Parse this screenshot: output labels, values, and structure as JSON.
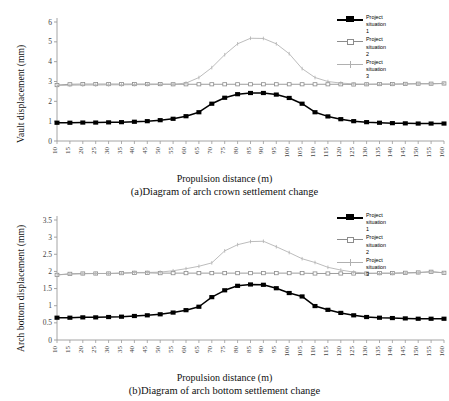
{
  "chart_data": [
    {
      "id": "a",
      "type": "line",
      "title": "(a)Diagram of arch crown settlement change",
      "xlabel": "Propulsion distance (m)",
      "ylabel": "Vault displacement (mm)",
      "xlim": [
        10,
        160
      ],
      "ylim": [
        0,
        6
      ],
      "yticks": [
        "0",
        "1",
        "2",
        "3",
        "4",
        "5",
        "6"
      ],
      "grid": false,
      "legend_position": "top-right",
      "x": [
        10,
        15,
        20,
        25,
        30,
        35,
        40,
        45,
        50,
        55,
        60,
        65,
        70,
        75,
        80,
        85,
        90,
        95,
        100,
        105,
        110,
        115,
        120,
        125,
        130,
        135,
        140,
        145,
        150,
        155,
        160
      ],
      "series": [
        {
          "name": "Project\nsituation\n1",
          "color": "#000000",
          "marker": "square",
          "values": [
            0.92,
            0.92,
            0.93,
            0.93,
            0.94,
            0.95,
            0.97,
            1.0,
            1.05,
            1.12,
            1.25,
            1.45,
            1.88,
            2.18,
            2.36,
            2.42,
            2.42,
            2.34,
            2.17,
            1.88,
            1.45,
            1.24,
            1.1,
            1.0,
            0.95,
            0.92,
            0.9,
            0.89,
            0.88,
            0.88,
            0.88
          ]
        },
        {
          "name": "Project\nsituation\n2",
          "color": "#8c8c8c",
          "marker": "square-open",
          "values": [
            2.82,
            2.86,
            2.87,
            2.87,
            2.87,
            2.87,
            2.87,
            2.87,
            2.87,
            2.86,
            2.86,
            2.86,
            2.86,
            2.86,
            2.86,
            2.86,
            2.86,
            2.86,
            2.86,
            2.86,
            2.86,
            2.86,
            2.86,
            2.85,
            2.86,
            2.87,
            2.87,
            2.88,
            2.89,
            2.89,
            2.9
          ]
        },
        {
          "name": "Project\nsituation\n3",
          "color": "#b0b0b0",
          "marker": "tick",
          "values": [
            2.8,
            2.81,
            2.82,
            2.82,
            2.83,
            2.83,
            2.84,
            2.84,
            2.85,
            2.86,
            2.92,
            3.2,
            3.7,
            4.35,
            4.9,
            5.18,
            5.17,
            4.9,
            4.4,
            3.65,
            3.2,
            3.0,
            2.92,
            2.88,
            2.86,
            2.86,
            2.86,
            2.87,
            2.88,
            2.88,
            2.9
          ]
        }
      ]
    },
    {
      "id": "b",
      "type": "line",
      "title": "(b)Diagram of arch bottom settlement change",
      "xlabel": "Propulsion distance (m)",
      "ylabel": "Arch bottom displacement (mm)",
      "xlim": [
        10,
        160
      ],
      "ylim": [
        0,
        3.5
      ],
      "yticks": [
        "0",
        "0.5",
        "1",
        "1.5",
        "2",
        "2.5",
        "3",
        "3.5"
      ],
      "grid": false,
      "legend_position": "top-right",
      "x": [
        10,
        15,
        20,
        25,
        30,
        35,
        40,
        45,
        50,
        55,
        60,
        65,
        70,
        75,
        80,
        85,
        90,
        95,
        100,
        105,
        110,
        115,
        120,
        125,
        130,
        135,
        140,
        145,
        150,
        155,
        160
      ],
      "series": [
        {
          "name": "Project\nsituation\n1",
          "color": "#000000",
          "marker": "square",
          "values": [
            0.65,
            0.65,
            0.66,
            0.66,
            0.67,
            0.68,
            0.7,
            0.72,
            0.75,
            0.8,
            0.87,
            0.97,
            1.25,
            1.45,
            1.58,
            1.62,
            1.61,
            1.51,
            1.37,
            1.27,
            0.99,
            0.88,
            0.79,
            0.72,
            0.67,
            0.65,
            0.64,
            0.63,
            0.62,
            0.62,
            0.62
          ]
        },
        {
          "name": "Project\nsituation\n2",
          "color": "#8c8c8c",
          "marker": "square-open",
          "values": [
            1.9,
            1.93,
            1.94,
            1.94,
            1.94,
            1.95,
            1.96,
            1.96,
            1.95,
            1.95,
            1.95,
            1.95,
            1.95,
            1.95,
            1.95,
            1.95,
            1.95,
            1.95,
            1.95,
            1.95,
            1.94,
            1.94,
            1.94,
            1.94,
            1.94,
            1.95,
            1.95,
            1.96,
            1.97,
            1.99,
            1.96
          ]
        },
        {
          "name": "Project\nsituation\n3",
          "color": "#b0b0b0",
          "marker": "tick",
          "values": [
            1.9,
            1.92,
            1.93,
            1.94,
            1.94,
            1.95,
            1.97,
            1.97,
            1.98,
            2.02,
            2.08,
            2.15,
            2.25,
            2.6,
            2.78,
            2.87,
            2.88,
            2.72,
            2.55,
            2.37,
            2.26,
            2.12,
            2.04,
            1.98,
            1.95,
            1.94,
            1.94,
            1.95,
            1.96,
            1.99,
            1.96
          ]
        }
      ]
    }
  ],
  "figures": {
    "a": {
      "caption": "(a)Diagram of arch crown settlement change",
      "xlabel": "Propulsion distance (m)",
      "ylabel": "Vault displacement (mm)",
      "legend": [
        {
          "label": "Project\nsituation\n1"
        },
        {
          "label": "Project\nsituation\n2"
        },
        {
          "label": "Project\nsituation\n3"
        }
      ]
    },
    "b": {
      "caption": "(b)Diagram of arch bottom settlement change",
      "xlabel": "Propulsion distance (m)",
      "ylabel": "Arch bottom displacement (mm)",
      "legend": [
        {
          "label": "Project\nsituation\n1"
        },
        {
          "label": "Project\nsituation\n2"
        },
        {
          "label": "Project\nsituation\n3"
        }
      ]
    }
  },
  "colors": {
    "series1": "#000000",
    "series2": "#8c8c8c",
    "series3": "#b0b0b0",
    "axis": "#9a9a9a",
    "text": "#1a1a1a"
  }
}
